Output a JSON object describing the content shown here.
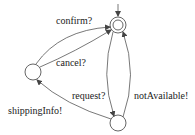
{
  "diagram": {
    "type": "state-machine",
    "states": [
      {
        "id": "s0",
        "initial": true,
        "accepting": true
      },
      {
        "id": "s1",
        "initial": false,
        "accepting": false
      },
      {
        "id": "s2",
        "initial": false,
        "accepting": false
      }
    ],
    "transitions": [
      {
        "from": "s1",
        "to": "s0",
        "label": "confirm?"
      },
      {
        "from": "s1",
        "to": "s0",
        "label": "cancel?"
      },
      {
        "from": "s0",
        "to": "s2",
        "label": "request?"
      },
      {
        "from": "s2",
        "to": "s0",
        "label": "notAvailable!"
      },
      {
        "from": "s2",
        "to": "s1",
        "label": "shippingInfo!"
      }
    ]
  }
}
